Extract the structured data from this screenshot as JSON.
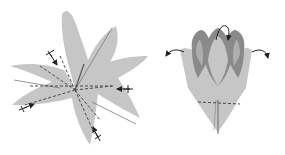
{
  "diagram": {
    "steps": [
      {
        "id": "step-star",
        "description": "Six-pointed star base with valley fold lines radiating from center; four fold-direction arrows",
        "fold_lines": 5,
        "arrows": 4
      },
      {
        "id": "step-flower",
        "description": "Flower form with three inner petals; arrows indicate petals curled outward",
        "petals": 3,
        "arrows": 3
      }
    ],
    "colors": {
      "paper_light": "#c6c6c6",
      "paper_dark": "#8a8a8a",
      "fold_line": "#4a4a4a",
      "arrow": "#222222",
      "background": "#ffffff"
    }
  }
}
